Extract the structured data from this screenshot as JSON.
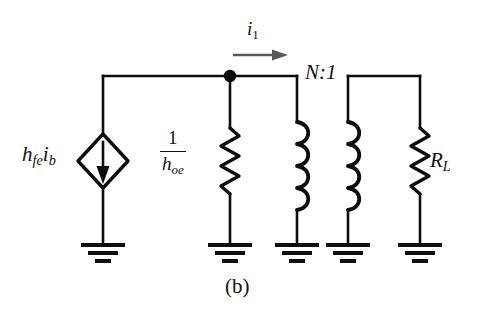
{
  "figure": {
    "caption": "(b)",
    "type": "circuit-schematic"
  },
  "labels": {
    "current_source": {
      "base": "h",
      "sub1": "fe",
      "base2": "i",
      "sub2": "b",
      "full": "hfe ib"
    },
    "output_resistance": {
      "numerator": "1",
      "denominator_base": "h",
      "denominator_sub": "oe",
      "full": "1/hoe"
    },
    "current": {
      "base": "i",
      "sub": "1",
      "full": "i1"
    },
    "turns_ratio": "N:1",
    "load_resistor": {
      "base": "R",
      "sub": "L",
      "full": "RL"
    }
  },
  "colors": {
    "wire": "#0d0d0d",
    "arrow": "#58585a",
    "background": "#ffffff",
    "text": "#111111"
  },
  "components": [
    {
      "name": "dependent-current-source",
      "label": "hfe ib",
      "x": 103,
      "direction": "down"
    },
    {
      "name": "resistor-1-over-hoe",
      "label": "1/hoe",
      "x": 230
    },
    {
      "name": "transformer-primary-coil",
      "x": 297,
      "turns": 4
    },
    {
      "name": "transformer-secondary-coil",
      "x": 348,
      "turns": 4
    },
    {
      "name": "load-resistor",
      "label": "RL",
      "x": 420
    }
  ],
  "nodes": [
    {
      "name": "junction-dot",
      "x": 230,
      "y": 76
    }
  ],
  "grounds": [
    103,
    230,
    297,
    348,
    420
  ]
}
